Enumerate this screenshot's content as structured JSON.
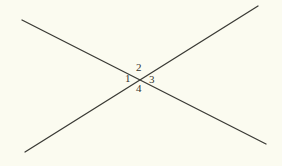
{
  "figure": {
    "type": "geometry-diagram",
    "background_color": "#fbfbf0",
    "line_color": "#3a3a35",
    "label_color": "#34342e",
    "canvas": {
      "width": 282,
      "height": 166
    },
    "intersection_point": {
      "x": 141,
      "y": 80
    },
    "lines": [
      {
        "name": "descending-line",
        "from": {
          "x": 22,
          "y": 20
        },
        "to": {
          "x": 266,
          "y": 144
        },
        "stroke_width": 1.3
      },
      {
        "name": "ascending-line",
        "from": {
          "x": 25,
          "y": 152
        },
        "to": {
          "x": 258,
          "y": 6
        },
        "stroke_width": 1.3
      }
    ],
    "angle_labels": [
      {
        "id": "1",
        "text": "1",
        "position": "left",
        "x": 129,
        "y": 79
      },
      {
        "id": "2",
        "text": "2",
        "position": "top",
        "x": 140,
        "y": 68
      },
      {
        "id": "3",
        "text": "3",
        "position": "right",
        "x": 153,
        "y": 80
      },
      {
        "id": "4",
        "text": "4",
        "position": "bottom",
        "x": 140,
        "y": 89
      }
    ]
  }
}
